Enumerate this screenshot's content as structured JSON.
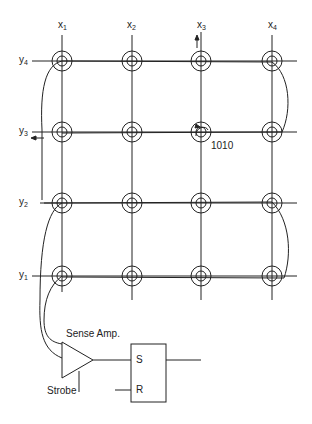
{
  "diagram": {
    "type": "core-memory-plane",
    "columns": [
      {
        "label": "x",
        "sub": "1",
        "x": 62
      },
      {
        "label": "x",
        "sub": "2",
        "x": 132
      },
      {
        "label": "x",
        "sub": "3",
        "x": 201
      },
      {
        "label": "x",
        "sub": "4",
        "x": 272
      }
    ],
    "rows": [
      {
        "label": "y",
        "sub": "4",
        "y": 61
      },
      {
        "label": "y",
        "sub": "3",
        "y": 132
      },
      {
        "label": "y",
        "sub": "2",
        "y": 203
      },
      {
        "label": "y",
        "sub": "1",
        "y": 276
      }
    ],
    "selected_core_label": "1010",
    "sense_amp_label": "Sense Amp.",
    "strobe_label": "Strobe",
    "flipflop": {
      "set_label": "S",
      "reset_label": "R"
    },
    "colors": {
      "line": "#222222",
      "background": "#ffffff"
    }
  }
}
